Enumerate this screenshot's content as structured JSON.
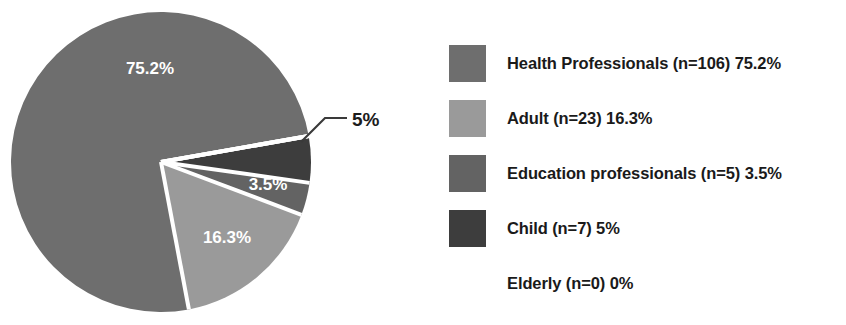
{
  "chart_data": {
    "type": "pie",
    "title": "",
    "labels": [
      "Health Professionals",
      "Adult",
      "Education professionals",
      "Child",
      "Elderly"
    ],
    "values": [
      106,
      23,
      5,
      7,
      0
    ],
    "percentages": [
      75.2,
      16.3,
      3.5,
      5,
      0
    ],
    "slice_labels": [
      "75.2%",
      "16.3%",
      "3.5%",
      "5%",
      ""
    ],
    "colors": [
      "#6e6e6e",
      "#9a9a9a",
      "#636363",
      "#3d3d3d",
      "#ffffff"
    ],
    "legend_position": "right",
    "grid": false,
    "start_angle_deg": -10,
    "direction": "counterclockwise",
    "callout": {
      "label": "5%",
      "for_slice": "Child"
    }
  },
  "pie": {
    "center_x": 161,
    "center_y": 162,
    "radius": 150,
    "slices": [
      {
        "name": "health-professionals",
        "percent": 75.2,
        "color": "#6e6e6e",
        "label": "75.2%",
        "label_x": 150,
        "label_y": 74
      },
      {
        "name": "adult",
        "percent": 16.3,
        "color": "#9a9a9a",
        "label": "16.3%",
        "label_x": 227,
        "label_y": 243
      },
      {
        "name": "education-professionals",
        "percent": 3.5,
        "color": "#636363",
        "label": "3.5%",
        "label_x": 268,
        "label_y": 190
      },
      {
        "name": "child",
        "percent": 5.0,
        "color": "#3d3d3d",
        "label": "",
        "label_x": 0,
        "label_y": 0
      },
      {
        "name": "elderly",
        "percent": 0.0,
        "color": "#ffffff",
        "label": "",
        "label_x": 0,
        "label_y": 0
      }
    ],
    "callout_text": "5%",
    "callout_text_x": 352,
    "callout_text_y": 126,
    "separator_color": "#ffffff"
  },
  "legend": {
    "items": [
      {
        "label": "Health Professionals (n=106) 75.2%",
        "color": "#6e6e6e",
        "has_swatch": true
      },
      {
        "label": "Adult (n=23) 16.3%",
        "color": "#9a9a9a",
        "has_swatch": true
      },
      {
        "label": "Education professionals (n=5) 3.5%",
        "color": "#636363",
        "has_swatch": true
      },
      {
        "label": "Child (n=7) 5%",
        "color": "#3d3d3d",
        "has_swatch": true
      },
      {
        "label": "Elderly (n=0) 0%",
        "color": "",
        "has_swatch": false
      }
    ]
  },
  "colors": {
    "background": "#ffffff",
    "text": "#1a1a1a",
    "slice_label_text": "#ffffff",
    "leader_line": "#3a3a3a"
  }
}
